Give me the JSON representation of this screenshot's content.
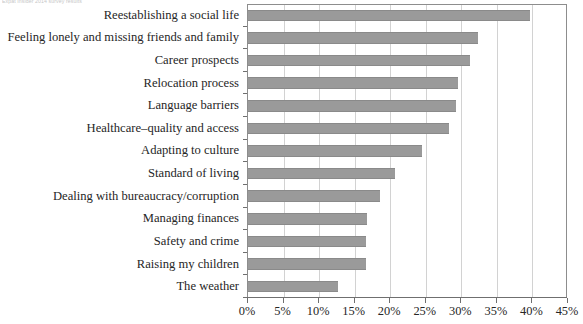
{
  "caption": "Expat Insider 2014 survey results",
  "chart_data": {
    "type": "bar",
    "orientation": "horizontal",
    "title": "",
    "subtitle": "",
    "xlabel": "",
    "ylabel": "",
    "xlim": [
      0,
      45
    ],
    "xtick_step": 5,
    "xtick_labels": [
      "0%",
      "5%",
      "10%",
      "15%",
      "20%",
      "25%",
      "30%",
      "35%",
      "40%",
      "45%"
    ],
    "xtick_values": [
      0,
      5,
      10,
      15,
      20,
      25,
      30,
      35,
      40,
      45
    ],
    "grid": true,
    "grid_axis": "x",
    "legend": false,
    "legend_position": "none",
    "bar_color": "#9a9a9a",
    "plot_background": "#ffffff",
    "gridline_color": "#d2d2d2",
    "axis_color": "#6f6f6f",
    "categories": [
      "Reestablishing a social life",
      "Feeling lonely and missing friends and family",
      "Career prospects",
      "Relocation process",
      "Language barriers",
      "Healthcare–quality and access",
      "Adapting to culture",
      "Standard of living",
      "Dealing with bureaucracy/corruption",
      "Managing finances",
      "Safety and crime",
      "Raising my children",
      "The weather"
    ],
    "values": [
      39.6,
      32.4,
      31.2,
      29.5,
      29.3,
      28.2,
      24.5,
      20.7,
      18.5,
      16.8,
      16.6,
      16.6,
      12.7
    ],
    "value_unit": "%"
  }
}
